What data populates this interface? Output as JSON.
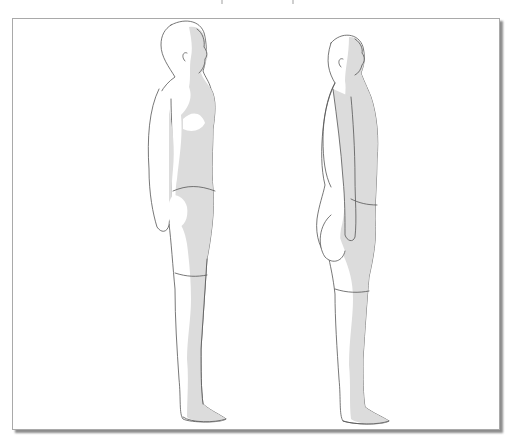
{
  "illustration": {
    "subject": "posture comparison, two male figures in side profile",
    "colors": {
      "background": "#ffffff",
      "frame_border": "#a9a9a9",
      "body_fill": "#ffffff",
      "shadow_fill": "#dcdcdc",
      "line": "#555555"
    },
    "figures": [
      {
        "name": "upright-posture",
        "position": "left"
      },
      {
        "name": "swayback-posture",
        "position": "right"
      }
    ]
  }
}
